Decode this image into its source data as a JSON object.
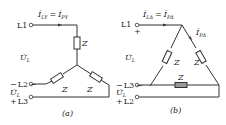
{
  "figure": {
    "panels": [
      {
        "id": "a",
        "caption": "(a)",
        "connection": "star",
        "terminals": [
          "L1",
          "L2",
          "L3"
        ],
        "current_label": "İLY = İPY",
        "current_main": "İ",
        "current_sub_left": "LY",
        "current_eq": "=",
        "current_sub_right": "PY",
        "voltage_label": "U̇L",
        "voltage_main": "U̇",
        "voltage_sub": "L",
        "impedance_label": "Z",
        "polarity_minus": "−",
        "polarity_plus": "+"
      },
      {
        "id": "b",
        "caption": "(b)",
        "connection": "delta",
        "terminals": [
          "L1",
          "L3",
          "L2"
        ],
        "current_label": "İLΔ = İPΔ",
        "current_main": "İ",
        "current_sub_left": "LΔ",
        "current_eq": "=",
        "current_sub_right": "PΔ",
        "phase_current_main": "İ",
        "phase_current_sub": "PΔ",
        "voltage_main": "U̇",
        "voltage_sub": "L",
        "impedance_label": "Z",
        "polarity_minus": "−",
        "polarity_plus": "+"
      }
    ]
  }
}
